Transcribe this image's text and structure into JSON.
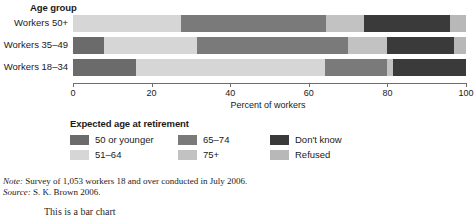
{
  "chart_data": {
    "type": "bar",
    "orientation": "horizontal",
    "stacked": true,
    "title": "",
    "group_axis_title": "Age group",
    "xlabel": "Percent of workers",
    "ylabel": "",
    "xlim": [
      0,
      100
    ],
    "xticks": [
      0,
      20,
      40,
      60,
      80,
      100
    ],
    "xtick_labels": [
      "0",
      "20",
      "40",
      "60",
      "80",
      "100"
    ],
    "grid": false,
    "legend_title": "Expected age at retirement",
    "legend_position": "bottom",
    "categories": [
      "Workers 50+",
      "Workers 35–49",
      "Workers 18–34"
    ],
    "series": [
      {
        "name": "50 or younger",
        "color": "#6b6b6b",
        "values": [
          0,
          8,
          16
        ]
      },
      {
        "name": "51–64",
        "color": "#d6d6d6",
        "values": [
          27.5,
          23.5,
          48
        ]
      },
      {
        "name": "65–74",
        "color": "#7a7a7a",
        "values": [
          37,
          38.5,
          16
        ]
      },
      {
        "name": "75+",
        "color": "#c2c2c2",
        "values": [
          9.5,
          10,
          1.5
        ]
      },
      {
        "name": "Don't know",
        "color": "#3a3a3a",
        "values": [
          22,
          17,
          18.5
        ]
      },
      {
        "name": "Refused",
        "color": "#b8b8b8",
        "values": [
          4,
          3,
          0
        ]
      }
    ]
  },
  "legend": {
    "title": "Expected age at retirement",
    "items": [
      {
        "label": "50 or younger",
        "color": "#6b6b6b"
      },
      {
        "label": "65–74",
        "color": "#7a7a7a"
      },
      {
        "label": "Don't know",
        "color": "#3a3a3a"
      },
      {
        "label": "51–64",
        "color": "#d6d6d6"
      },
      {
        "label": "75+",
        "color": "#c2c2c2"
      },
      {
        "label": "Refused",
        "color": "#b8b8b8"
      }
    ]
  },
  "notes": {
    "note_key": "Note:",
    "note_text": " Survey of 1,053 workers 18 and over conducted in July 2006.",
    "source_key": "Source:",
    "source_text": " S. K. Brown 2006."
  },
  "artifact": {
    "text": "This is a bar chart"
  }
}
